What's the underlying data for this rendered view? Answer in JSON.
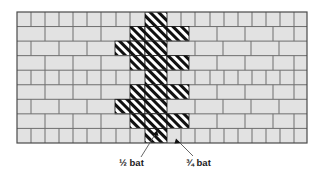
{
  "figure": {
    "wall": {
      "x": 17,
      "y": 12,
      "width": 290,
      "height": 131,
      "courses": 9,
      "course_height": 14.55,
      "brick_fill": "#e2e2e2",
      "mortar_color": "#6e6e6e",
      "outline_color": "#4a4a4a",
      "hatch_fill": "#ffffff",
      "hatch_stroke": "#111111"
    },
    "labels": [
      {
        "id": "half-bat",
        "text": "½ bat",
        "x": 119,
        "y": 163,
        "leader": {
          "x1": 141,
          "y1": 157,
          "x2": 156,
          "y2": 133
        },
        "arrow": {
          "x": 157,
          "y": 131
        }
      },
      {
        "id": "three-quarter-bat",
        "text": "¾ bat",
        "x": 186,
        "y": 163,
        "leader": {
          "x1": 193,
          "y1": 156,
          "x2": 178,
          "y2": 141
        },
        "arrow": {
          "x": 176,
          "y": 139
        }
      }
    ],
    "courses_layout": [
      {
        "row": 0,
        "type": "header-course",
        "plain_left": [
          17,
          31,
          45,
          59,
          73,
          87,
          101,
          116,
          130
        ],
        "hatched": [
          [
            145,
            22
          ]
        ],
        "plain_right": [
          167,
          181,
          195,
          210,
          224,
          238,
          252,
          266,
          280,
          294
        ]
      },
      {
        "row": 1,
        "type": "stretcher-course",
        "plain_left": [
          17,
          45,
          73,
          101
        ],
        "hatched": [
          [
            130,
            15
          ],
          [
            145,
            22
          ],
          [
            167,
            22
          ]
        ],
        "plain_right": [
          189,
          217,
          245,
          273,
          294
        ]
      },
      {
        "row": 2,
        "type": "stretcher-course",
        "plain_left": [
          17,
          31,
          59,
          87
        ],
        "hatched": [
          [
            115,
            15
          ],
          [
            130,
            15
          ],
          [
            145,
            22
          ]
        ],
        "plain_right": [
          167,
          195,
          223,
          251,
          279
        ]
      },
      {
        "row": 3,
        "type": "stretcher-course",
        "plain_left": [
          17,
          45,
          73,
          101
        ],
        "hatched": [
          [
            130,
            15
          ],
          [
            145,
            22
          ],
          [
            167,
            22
          ]
        ],
        "plain_right": [
          189,
          217,
          245,
          273,
          294
        ]
      },
      {
        "row": 4,
        "type": "header-course",
        "plain_left": [
          17,
          31,
          45,
          59,
          73,
          87,
          101,
          116,
          130
        ],
        "hatched": [
          [
            145,
            22
          ]
        ],
        "plain_right": [
          167,
          181,
          195,
          210,
          224,
          238,
          252,
          266,
          280,
          294
        ]
      },
      {
        "row": 5,
        "type": "stretcher-course",
        "plain_left": [
          17,
          45,
          73,
          101
        ],
        "hatched": [
          [
            130,
            15
          ],
          [
            145,
            22
          ],
          [
            167,
            22
          ]
        ],
        "plain_right": [
          189,
          217,
          245,
          273,
          294
        ]
      },
      {
        "row": 6,
        "type": "stretcher-course",
        "plain_left": [
          17,
          31,
          59,
          87
        ],
        "hatched": [
          [
            115,
            15
          ],
          [
            130,
            15
          ],
          [
            145,
            22
          ]
        ],
        "plain_right": [
          167,
          195,
          223,
          251,
          279
        ]
      },
      {
        "row": 7,
        "type": "stretcher-course",
        "plain_left": [
          17,
          45,
          73,
          101
        ],
        "hatched": [
          [
            130,
            15
          ],
          [
            145,
            22
          ],
          [
            167,
            22
          ]
        ],
        "plain_right": [
          189,
          217,
          245,
          273,
          294
        ]
      },
      {
        "row": 8,
        "type": "header-course",
        "plain_left": [
          17,
          31,
          45,
          59,
          73,
          87,
          101,
          116,
          130
        ],
        "hatched": [
          [
            145,
            22
          ]
        ],
        "plain_right": [
          167,
          181,
          195,
          210,
          224,
          238,
          252,
          266,
          280,
          294
        ]
      }
    ]
  }
}
